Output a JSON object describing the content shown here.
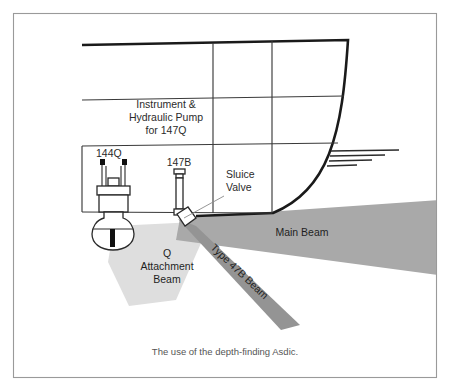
{
  "figure": {
    "caption": "The use of the depth-finding Asdic.",
    "border_color": "#9a9a9a",
    "background": "#ffffff"
  },
  "labels": {
    "instrument_line1": "Instrument &",
    "instrument_line2": "Hydraulic Pump",
    "instrument_line3": "for 147Q",
    "code_144q": "144Q",
    "code_147b": "147B",
    "sluice_line1": "Sluice",
    "sluice_line2": "Valve",
    "main_beam": "Main Beam",
    "q_beam_line1": "Q",
    "q_beam_line2": "Attachment",
    "q_beam_line3": "Beam",
    "type_47b_beam": "Type 47B Beam"
  },
  "beams": [
    {
      "name": "main-beam",
      "label": "Main Beam",
      "color": "#a8a8a8",
      "origin": "147B transducer",
      "direction": "starboard-horizontal",
      "shape": "wedge"
    },
    {
      "name": "q-attachment-beam",
      "label": "Q Attachment Beam",
      "color": "#dcdcdc",
      "origin": "144Q dome",
      "direction": "downward-fan",
      "shape": "fan"
    },
    {
      "name": "type-47b-beam",
      "label": "Type 47B Beam",
      "color": "#949494",
      "origin": "147B transducer",
      "direction": "down-starboard-diagonal",
      "shape": "narrow-ray"
    }
  ],
  "hull": {
    "stroke_heavy": "#1a1a1a",
    "stroke_light": "#3a3a3a",
    "waterline_marks": 4
  },
  "equipment": [
    {
      "name": "144Q",
      "type": "retractable-dome-asdic",
      "label": "144Q"
    },
    {
      "name": "147B",
      "type": "sluice-valve-transducer",
      "label": "147B"
    },
    {
      "name": "sluice-valve",
      "type": "valve",
      "label": "Sluice Valve"
    }
  ]
}
